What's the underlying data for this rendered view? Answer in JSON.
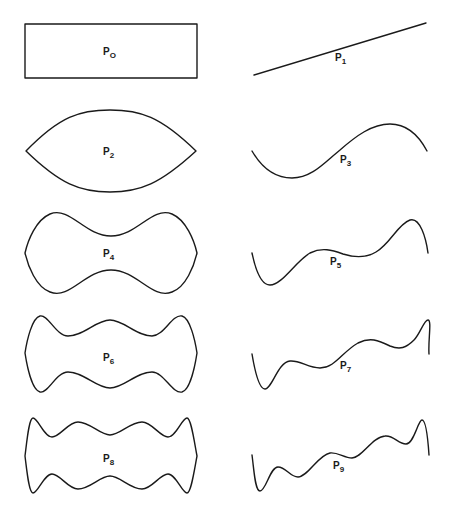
{
  "figure": {
    "panels": [
      {
        "id": "p0",
        "label": "P",
        "index": "O",
        "kind": "closed",
        "shape": "rectangle",
        "label_pos": [
          103,
          47
        ]
      },
      {
        "id": "p1",
        "label": "P",
        "index": "1",
        "kind": "open",
        "shape": "straight line",
        "label_pos": [
          335,
          53
        ]
      },
      {
        "id": "p2",
        "label": "P",
        "index": "2",
        "kind": "closed",
        "shape": "lens",
        "label_pos": [
          103,
          147
        ]
      },
      {
        "id": "p3",
        "label": "P",
        "index": "3",
        "kind": "open",
        "shape": "cubic wave",
        "label_pos": [
          340,
          155
        ]
      },
      {
        "id": "p4",
        "label": "P",
        "index": "4",
        "kind": "closed",
        "shape": "bowtie 2 lobes",
        "label_pos": [
          103,
          249
        ]
      },
      {
        "id": "p5",
        "label": "P",
        "index": "5",
        "kind": "open",
        "shape": "quintic wave",
        "label_pos": [
          330,
          257
        ]
      },
      {
        "id": "p6",
        "label": "P",
        "index": "6",
        "kind": "closed",
        "shape": "wavy 3 lobes",
        "label_pos": [
          103,
          353
        ]
      },
      {
        "id": "p7",
        "label": "P",
        "index": "7",
        "kind": "open",
        "shape": "degree-7 wave",
        "label_pos": [
          340,
          361
        ]
      },
      {
        "id": "p8",
        "label": "P",
        "index": "8",
        "kind": "closed",
        "shape": "wavy 4 lobes",
        "label_pos": [
          103,
          454
        ]
      },
      {
        "id": "p9",
        "label": "P",
        "index": "9",
        "kind": "open",
        "shape": "degree-9 wave",
        "label_pos": [
          333,
          461
        ]
      }
    ],
    "stroke_color": "#1a1a1a",
    "background": "#ffffff"
  }
}
